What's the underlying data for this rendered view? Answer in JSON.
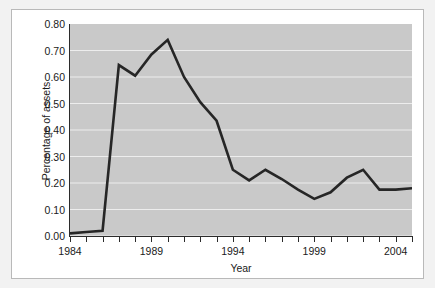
{
  "chart_data": {
    "type": "line",
    "title": "",
    "xlabel": "Year",
    "ylabel": "Percentage of assets",
    "xlim": [
      1984,
      2005
    ],
    "ylim": [
      0.0,
      0.8
    ],
    "grid": true,
    "legend": "none",
    "y_ticks": [
      "0.00",
      "0.10",
      "0.20",
      "0.30",
      "0.40",
      "0.50",
      "0.60",
      "0.70",
      "0.80"
    ],
    "y_tick_values": [
      0.0,
      0.1,
      0.2,
      0.3,
      0.4,
      0.5,
      0.6,
      0.7,
      0.8
    ],
    "x_ticks": [
      "1984",
      "1989",
      "1994",
      "1999",
      "2004"
    ],
    "x_tick_values": [
      1984,
      1989,
      1994,
      1999,
      2004
    ],
    "x_minor_tick_values": [
      1984,
      1985,
      1986,
      1987,
      1988,
      1989,
      1990,
      1991,
      1992,
      1993,
      1994,
      1995,
      1996,
      1997,
      1998,
      1999,
      2000,
      2001,
      2002,
      2003,
      2004,
      2005
    ],
    "series": [
      {
        "name": "Percentage of assets",
        "color": "#262626",
        "x": [
          1984,
          1985,
          1986,
          1987,
          1988,
          1989,
          1990,
          1991,
          1992,
          1993,
          1994,
          1995,
          1996,
          1997,
          1998,
          1999,
          2000,
          2001,
          2002,
          2003,
          2004,
          2005
        ],
        "values": [
          0.01,
          0.015,
          0.02,
          0.645,
          0.605,
          0.685,
          0.74,
          0.6,
          0.505,
          0.435,
          0.25,
          0.21,
          0.25,
          0.215,
          0.175,
          0.14,
          0.165,
          0.22,
          0.25,
          0.175,
          0.175,
          0.18
        ]
      }
    ]
  },
  "figure": {
    "plot_background": "#c9c9c9",
    "card_background": "#ffffff",
    "page_background": "#f2f2f2",
    "gridline_color": "#ededed",
    "axis_color": "#2b2b2b",
    "line_color": "#262626"
  }
}
